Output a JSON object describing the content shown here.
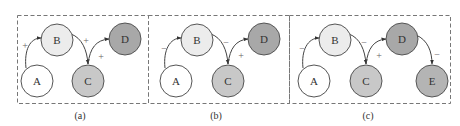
{
  "colors": {
    "A": "#ffffff",
    "B": "#ececec",
    "C": "#c8c8c8",
    "D": "#a8a8a8",
    "E": "#b4b4b4"
  },
  "panels": [
    {
      "caption": "(a)",
      "nodes": [
        {
          "id": "A",
          "label": "A"
        },
        {
          "id": "B",
          "label": "B"
        },
        {
          "id": "C",
          "label": "C"
        },
        {
          "id": "D",
          "label": "D"
        }
      ],
      "edges": [
        {
          "from": "A",
          "to": "B",
          "sign": "+"
        },
        {
          "from": "B",
          "to": "C",
          "sign": "+"
        },
        {
          "from": "C",
          "to": "D",
          "sign": "+"
        }
      ]
    },
    {
      "caption": "(b)",
      "nodes": [
        {
          "id": "A",
          "label": "A"
        },
        {
          "id": "B",
          "label": "B"
        },
        {
          "id": "C",
          "label": "C"
        },
        {
          "id": "D",
          "label": "D"
        }
      ],
      "edges": [
        {
          "from": "A",
          "to": "B",
          "sign": "−"
        },
        {
          "from": "B",
          "to": "C",
          "sign": "−"
        },
        {
          "from": "C",
          "to": "D",
          "sign": "+"
        }
      ]
    },
    {
      "caption": "(c)",
      "nodes": [
        {
          "id": "A",
          "label": "A"
        },
        {
          "id": "B",
          "label": "B"
        },
        {
          "id": "C",
          "label": "C"
        },
        {
          "id": "D",
          "label": "D"
        },
        {
          "id": "E",
          "label": "E"
        }
      ],
      "edges": [
        {
          "from": "A",
          "to": "B",
          "sign": "−"
        },
        {
          "from": "B",
          "to": "C",
          "sign": "−"
        },
        {
          "from": "C",
          "to": "D",
          "sign": "+"
        },
        {
          "from": "D",
          "to": "E",
          "sign": "−"
        }
      ]
    }
  ]
}
